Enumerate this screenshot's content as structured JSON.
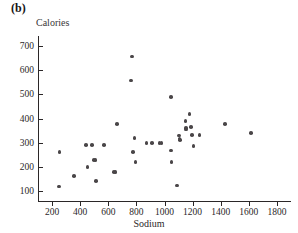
{
  "figure": {
    "panel_label": "(b)",
    "background_color": "#ffffff",
    "point_color": "#4a4648",
    "axis_color": "#2b2728"
  },
  "chart_data": {
    "type": "scatter",
    "title": "",
    "panel_label": "(b)",
    "xlabel": "Sodium",
    "ylabel": "Calories",
    "xlim": [
      100,
      1900
    ],
    "ylim": [
      60,
      740
    ],
    "xticks": [
      200,
      400,
      600,
      800,
      1000,
      1200,
      1400,
      1600,
      1800
    ],
    "xtick_labels": [
      "200",
      "400",
      "600",
      "800",
      "1000",
      "1200",
      "1400",
      "1600",
      "1800"
    ],
    "yticks": [
      100,
      200,
      300,
      400,
      500,
      600,
      700
    ],
    "ytick_labels": [
      "100",
      "200",
      "300",
      "400",
      "500",
      "600",
      "700"
    ],
    "grid": false,
    "legend": false,
    "marker": "filled-circle",
    "series": [
      {
        "name": "hot dogs",
        "points": [
          [
            250,
            120
          ],
          [
            253,
            262
          ],
          [
            355,
            162
          ],
          [
            440,
            290
          ],
          [
            452,
            200
          ],
          [
            483,
            290
          ],
          [
            500,
            228
          ],
          [
            508,
            230
          ],
          [
            513,
            142
          ],
          [
            568,
            290
          ],
          [
            640,
            180
          ],
          [
            652,
            180
          ],
          [
            660,
            378
          ],
          [
            763,
            557
          ],
          [
            770,
            655
          ],
          [
            775,
            262
          ],
          [
            788,
            320
          ],
          [
            793,
            220
          ],
          [
            873,
            300
          ],
          [
            913,
            300
          ],
          [
            963,
            300
          ],
          [
            980,
            300
          ],
          [
            1045,
            488
          ],
          [
            1048,
            268
          ],
          [
            1050,
            220
          ],
          [
            1090,
            124
          ],
          [
            1105,
            330
          ],
          [
            1108,
            318
          ],
          [
            1112,
            312
          ],
          [
            1150,
            390
          ],
          [
            1152,
            360
          ],
          [
            1155,
            355
          ],
          [
            1178,
            418
          ],
          [
            1190,
            365
          ],
          [
            1195,
            332
          ],
          [
            1205,
            287
          ],
          [
            1248,
            332
          ],
          [
            1430,
            377
          ],
          [
            1615,
            340
          ]
        ]
      }
    ]
  }
}
